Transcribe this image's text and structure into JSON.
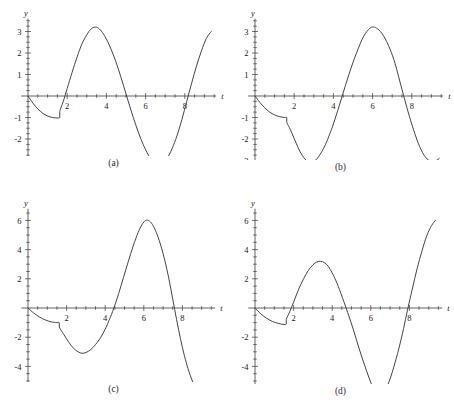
{
  "figure": {
    "panel_count": 4,
    "curve_color": "#3a3a3a",
    "axis_color": "#3a3a3a",
    "background": "#ffffff"
  },
  "panels": [
    {
      "id": "a",
      "caption": "(a)",
      "xlabel": "t",
      "ylabel": "y",
      "chart_data": {
        "type": "line",
        "title": "",
        "xlabel": "t",
        "ylabel": "y",
        "xlim": [
          -0.35,
          9.6
        ],
        "ylim": [
          -3.6,
          3.6
        ],
        "grid": false,
        "legend_position": "none",
        "xticks": [
          2,
          4,
          6,
          8
        ],
        "xtick_labels": [
          "2",
          "4",
          "6",
          "8"
        ],
        "xminor_step": 0.5,
        "yticks": [
          3,
          2,
          1,
          -1,
          -2,
          -3
        ],
        "ytick_labels": [
          "3",
          "2",
          "1",
          "-1",
          "-2",
          "-3"
        ],
        "yminor_step": 0.25,
        "series": [
          {
            "name": "y(t)",
            "points": [
              [
                0.0,
                0.0
              ],
              [
                0.25,
                -0.33
              ],
              [
                0.5,
                -0.6
              ],
              [
                0.75,
                -0.8
              ],
              [
                1.0,
                -0.93
              ],
              [
                1.25,
                -1.0
              ],
              [
                1.5,
                -1.02
              ],
              [
                1.62,
                -1.0
              ],
              [
                1.62,
                -0.72
              ],
              [
                1.8,
                -0.25
              ],
              [
                2.0,
                0.35
              ],
              [
                2.25,
                1.1
              ],
              [
                2.5,
                1.8
              ],
              [
                2.75,
                2.42
              ],
              [
                3.0,
                2.85
              ],
              [
                3.2,
                3.1
              ],
              [
                3.4,
                3.2
              ],
              [
                3.6,
                3.15
              ],
              [
                3.8,
                2.95
              ],
              [
                4.0,
                2.65
              ],
              [
                4.25,
                2.15
              ],
              [
                4.5,
                1.55
              ],
              [
                4.75,
                0.85
              ],
              [
                5.0,
                0.1
              ],
              [
                5.25,
                -0.65
              ],
              [
                5.5,
                -1.35
              ],
              [
                5.75,
                -1.98
              ],
              [
                6.0,
                -2.5
              ],
              [
                6.25,
                -2.9
              ],
              [
                6.5,
                -3.12
              ],
              [
                6.7,
                -3.2
              ],
              [
                6.9,
                -3.12
              ],
              [
                7.1,
                -2.9
              ],
              [
                7.35,
                -2.45
              ],
              [
                7.6,
                -1.85
              ],
              [
                7.85,
                -1.1
              ],
              [
                8.1,
                -0.25
              ],
              [
                8.35,
                0.6
              ],
              [
                8.6,
                1.4
              ],
              [
                8.85,
                2.1
              ],
              [
                9.1,
                2.68
              ],
              [
                9.35,
                3.0
              ]
            ]
          }
        ]
      }
    },
    {
      "id": "b",
      "caption": "(b)",
      "xlabel": "t",
      "ylabel": "y",
      "chart_data": {
        "type": "line",
        "title": "",
        "xlabel": "t",
        "ylabel": "y",
        "xlim": [
          -0.35,
          9.6
        ],
        "ylim": [
          -3.6,
          3.6
        ],
        "grid": false,
        "legend_position": "none",
        "xticks": [
          2,
          4,
          6,
          8
        ],
        "xtick_labels": [
          "2",
          "4",
          "6",
          "8"
        ],
        "xminor_step": 0.5,
        "yticks": [
          3,
          2,
          1,
          -1,
          -2,
          -3
        ],
        "ytick_labels": [
          "3",
          "2",
          "1",
          "-1",
          "-2",
          "-3"
        ],
        "yminor_step": 0.25,
        "series": [
          {
            "name": "y(t)",
            "points": [
              [
                0.0,
                0.0
              ],
              [
                0.25,
                -0.3
              ],
              [
                0.5,
                -0.55
              ],
              [
                0.75,
                -0.75
              ],
              [
                1.0,
                -0.88
              ],
              [
                1.25,
                -0.96
              ],
              [
                1.5,
                -1.0
              ],
              [
                1.62,
                -1.0
              ],
              [
                1.62,
                -1.22
              ],
              [
                1.8,
                -1.55
              ],
              [
                2.0,
                -1.98
              ],
              [
                2.2,
                -2.4
              ],
              [
                2.4,
                -2.75
              ],
              [
                2.6,
                -2.98
              ],
              [
                2.8,
                -3.1
              ],
              [
                3.0,
                -3.05
              ],
              [
                3.2,
                -2.88
              ],
              [
                3.4,
                -2.6
              ],
              [
                3.6,
                -2.25
              ],
              [
                3.8,
                -1.8
              ],
              [
                4.0,
                -1.3
              ],
              [
                4.3,
                -0.45
              ],
              [
                4.6,
                0.45
              ],
              [
                4.9,
                1.3
              ],
              [
                5.2,
                2.05
              ],
              [
                5.5,
                2.7
              ],
              [
                5.75,
                3.05
              ],
              [
                5.95,
                3.2
              ],
              [
                6.15,
                3.18
              ],
              [
                6.4,
                3.0
              ],
              [
                6.65,
                2.65
              ],
              [
                6.9,
                2.15
              ],
              [
                7.15,
                1.5
              ],
              [
                7.5,
                0.3
              ],
              [
                7.8,
                -0.7
              ],
              [
                8.1,
                -1.6
              ],
              [
                8.4,
                -2.35
              ],
              [
                8.7,
                -2.85
              ],
              [
                9.0,
                -3.05
              ],
              [
                9.25,
                -3.0
              ],
              [
                9.4,
                -2.9
              ]
            ]
          }
        ]
      }
    },
    {
      "id": "c",
      "caption": "(c)",
      "xlabel": "t",
      "ylabel": "y",
      "chart_data": {
        "type": "line",
        "title": "",
        "xlabel": "t",
        "ylabel": "y",
        "xlim": [
          -0.35,
          9.7
        ],
        "ylim": [
          -6.8,
          6.8
        ],
        "grid": false,
        "legend_position": "none",
        "xticks": [
          2,
          4,
          6,
          8
        ],
        "xtick_labels": [
          "2",
          "4",
          "6",
          "8"
        ],
        "xminor_step": 0.5,
        "yticks": [
          6,
          4,
          2,
          -2,
          -4,
          -6
        ],
        "ytick_labels": [
          "6",
          "4",
          "2",
          "-2",
          "-4",
          "-6"
        ],
        "yminor_step": 0.5,
        "series": [
          {
            "name": "y(t)",
            "points": [
              [
                0.0,
                0.0
              ],
              [
                0.3,
                -0.35
              ],
              [
                0.6,
                -0.62
              ],
              [
                0.9,
                -0.82
              ],
              [
                1.2,
                -0.95
              ],
              [
                1.5,
                -1.0
              ],
              [
                1.62,
                -1.0
              ],
              [
                1.62,
                -1.3
              ],
              [
                1.85,
                -1.8
              ],
              [
                2.1,
                -2.32
              ],
              [
                2.35,
                -2.75
              ],
              [
                2.6,
                -3.0
              ],
              [
                2.8,
                -3.1
              ],
              [
                3.0,
                -3.05
              ],
              [
                3.25,
                -2.85
              ],
              [
                3.5,
                -2.5
              ],
              [
                3.75,
                -2.05
              ],
              [
                4.0,
                -1.45
              ],
              [
                4.2,
                -0.85
              ],
              [
                4.45,
                0.0
              ],
              [
                4.7,
                1.0
              ],
              [
                4.95,
                2.1
              ],
              [
                5.2,
                3.2
              ],
              [
                5.45,
                4.25
              ],
              [
                5.7,
                5.15
              ],
              [
                5.9,
                5.7
              ],
              [
                6.1,
                6.0
              ],
              [
                6.3,
                5.95
              ],
              [
                6.5,
                5.6
              ],
              [
                6.7,
                5.0
              ],
              [
                6.9,
                4.2
              ],
              [
                7.1,
                3.2
              ],
              [
                7.3,
                2.0
              ],
              [
                7.5,
                0.6
              ],
              [
                7.7,
                -0.8
              ],
              [
                7.9,
                -2.1
              ],
              [
                8.1,
                -3.25
              ],
              [
                8.35,
                -4.4
              ],
              [
                8.6,
                -5.25
              ],
              [
                8.85,
                -5.75
              ],
              [
                9.1,
                -5.95
              ],
              [
                9.35,
                -5.9
              ],
              [
                9.5,
                -5.8
              ]
            ]
          }
        ]
      }
    },
    {
      "id": "d",
      "caption": "(d)",
      "xlabel": "t",
      "ylabel": "y",
      "chart_data": {
        "type": "line",
        "title": "",
        "xlabel": "t",
        "ylabel": "y",
        "xlim": [
          -0.35,
          9.7
        ],
        "ylim": [
          -6.8,
          6.8
        ],
        "grid": false,
        "legend_position": "none",
        "xticks": [
          2,
          4,
          6,
          8
        ],
        "xtick_labels": [
          "2",
          "4",
          "6",
          "8"
        ],
        "xminor_step": 0.5,
        "yticks": [
          6,
          4,
          2,
          -2,
          -4,
          -6
        ],
        "ytick_labels": [
          "6",
          "4",
          "2",
          "-2",
          "-4",
          "-6"
        ],
        "yminor_step": 0.5,
        "series": [
          {
            "name": "y(t)",
            "points": [
              [
                0.0,
                0.0
              ],
              [
                0.3,
                -0.4
              ],
              [
                0.6,
                -0.7
              ],
              [
                0.9,
                -0.92
              ],
              [
                1.2,
                -1.05
              ],
              [
                1.45,
                -1.12
              ],
              [
                1.62,
                -1.1
              ],
              [
                1.62,
                -0.78
              ],
              [
                1.8,
                -0.25
              ],
              [
                2.0,
                0.4
              ],
              [
                2.25,
                1.25
              ],
              [
                2.5,
                1.95
              ],
              [
                2.75,
                2.55
              ],
              [
                3.0,
                2.95
              ],
              [
                3.2,
                3.15
              ],
              [
                3.4,
                3.2
              ],
              [
                3.6,
                3.1
              ],
              [
                3.8,
                2.85
              ],
              [
                4.0,
                2.4
              ],
              [
                4.2,
                1.85
              ],
              [
                4.45,
                1.0
              ],
              [
                4.8,
                -0.3
              ],
              [
                5.1,
                -1.5
              ],
              [
                5.4,
                -2.8
              ],
              [
                5.7,
                -4.0
              ],
              [
                6.0,
                -5.1
              ],
              [
                6.2,
                -5.7
              ],
              [
                6.4,
                -5.98
              ],
              [
                6.6,
                -5.9
              ],
              [
                6.8,
                -5.5
              ],
              [
                7.0,
                -4.85
              ],
              [
                7.2,
                -4.0
              ],
              [
                7.45,
                -2.8
              ],
              [
                7.7,
                -1.4
              ],
              [
                7.9,
                -0.15
              ],
              [
                8.15,
                1.3
              ],
              [
                8.4,
                2.7
              ],
              [
                8.65,
                3.9
              ],
              [
                8.9,
                4.95
              ],
              [
                9.15,
                5.65
              ],
              [
                9.35,
                6.0
              ]
            ]
          }
        ]
      }
    }
  ]
}
